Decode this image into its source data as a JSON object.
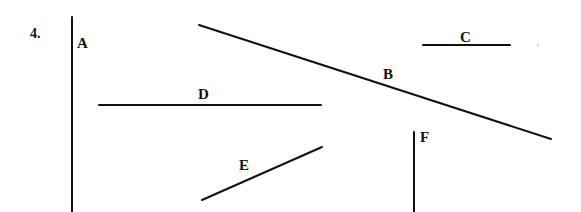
{
  "problem_number": "4.",
  "segments": [
    {
      "label": "A",
      "orientation": "vertical"
    },
    {
      "label": "B",
      "orientation": "diagonal-down"
    },
    {
      "label": "C",
      "orientation": "horizontal"
    },
    {
      "label": "D",
      "orientation": "horizontal"
    },
    {
      "label": "E",
      "orientation": "diagonal-up"
    },
    {
      "label": "F",
      "orientation": "vertical"
    }
  ]
}
